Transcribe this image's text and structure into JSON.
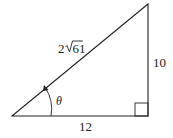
{
  "figure": {
    "type": "right-triangle",
    "labels": {
      "hypotenuse_coefficient": "2",
      "hypotenuse_radicand": "61",
      "opposite": "10",
      "adjacent": "12",
      "angle": "θ"
    },
    "right_angle_marker": true,
    "angle_arrow": true,
    "colors": {
      "stroke": "#222222",
      "background": "#ffffff"
    }
  }
}
